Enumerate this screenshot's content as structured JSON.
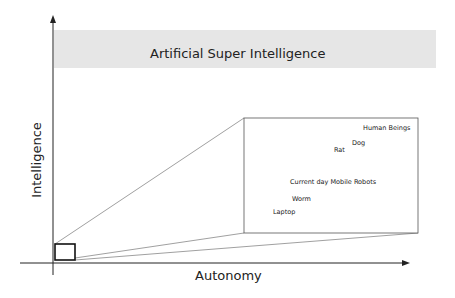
{
  "diagram": {
    "band": {
      "label": "Artificial Super Intelligence",
      "color": "#e6e6e6"
    },
    "axes": {
      "x_label": "Autonomy",
      "y_label": "Intelligence"
    },
    "zoom_box": {
      "points": [
        {
          "label": "Human Beings",
          "x": 363,
          "y": 125
        },
        {
          "label": "Dog",
          "x": 352,
          "y": 140
        },
        {
          "label": "Rat",
          "x": 334,
          "y": 147
        },
        {
          "label": "Current day Mobile Robots",
          "x": 290,
          "y": 179
        },
        {
          "label": "Worm",
          "x": 292,
          "y": 196
        },
        {
          "label": "Laptop",
          "x": 273,
          "y": 209
        }
      ]
    }
  }
}
